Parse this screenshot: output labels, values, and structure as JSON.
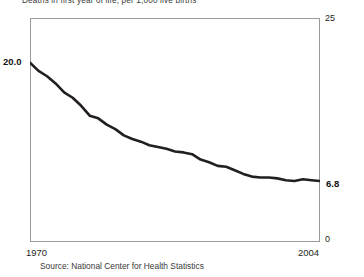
{
  "subtitle": "Deaths in first year of life, per 1,000 live births",
  "source_note": "Source: National Center for Health Statistics",
  "axis": {
    "y_max_label": "25",
    "y_min_label": "0",
    "year_start_label": "1970",
    "year_end_label": "2004"
  },
  "callouts": {
    "start_value": "20.0",
    "end_value": "6.8"
  },
  "colors": {
    "line": "#231f20",
    "frame": "#9a9a9a",
    "text": "#231f20",
    "background": "#ffffff"
  },
  "chart_data": {
    "type": "line",
    "title": "",
    "subtitle": "Deaths in first year of life, per 1,000 live births",
    "xlabel": "",
    "ylabel": "",
    "xlim": [
      1970,
      2004
    ],
    "ylim": [
      0,
      25
    ],
    "grid": false,
    "legend": "none",
    "y_axis_position": "right",
    "y_ticks": [
      0,
      25
    ],
    "x_ticks": [
      1970,
      2004
    ],
    "annotations": [
      {
        "text": "20.0",
        "x": 1970,
        "y": 20.0,
        "position": "left"
      },
      {
        "text": "6.8",
        "x": 2004,
        "y": 6.8,
        "position": "right"
      }
    ],
    "series": [
      {
        "name": "Infant mortality rate",
        "x": [
          1970,
          1971,
          1972,
          1973,
          1974,
          1975,
          1976,
          1977,
          1978,
          1979,
          1980,
          1981,
          1982,
          1983,
          1984,
          1985,
          1986,
          1987,
          1988,
          1989,
          1990,
          1991,
          1992,
          1993,
          1994,
          1995,
          1996,
          1997,
          1998,
          1999,
          2000,
          2001,
          2002,
          2003,
          2004
        ],
        "values": [
          20.0,
          19.1,
          18.5,
          17.7,
          16.7,
          16.1,
          15.2,
          14.1,
          13.8,
          13.1,
          12.6,
          11.9,
          11.5,
          11.2,
          10.8,
          10.6,
          10.4,
          10.1,
          10.0,
          9.8,
          9.2,
          8.9,
          8.5,
          8.4,
          8.0,
          7.6,
          7.3,
          7.2,
          7.2,
          7.1,
          6.9,
          6.8,
          7.0,
          6.9,
          6.8
        ]
      }
    ]
  }
}
